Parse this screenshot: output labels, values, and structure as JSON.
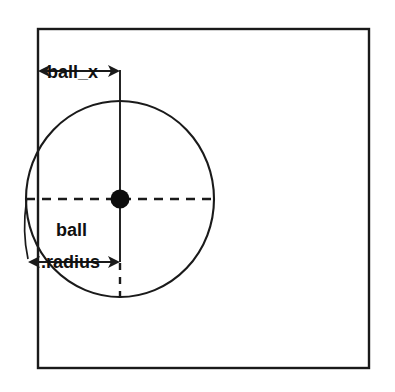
{
  "diagram": {
    "background_color": "#ffffff",
    "stroke_color": "#1a1a1a",
    "text_color": "#101010",
    "labels": {
      "ball_x": "ball_x",
      "ball_radius_line1": "ball",
      "ball_radius_line2": ".radius"
    },
    "shapes": {
      "play_field": {
        "name": "playfield-rectangle",
        "x": 38,
        "y": 29,
        "width": 331,
        "height": 339
      },
      "ball": {
        "name": "ball-circle",
        "center_x": 120,
        "center_y": 199,
        "radius_x": 94,
        "radius_y": 98
      },
      "ball_center_dot": {
        "name": "ball-center-dot",
        "center_x": 120,
        "center_y": 199,
        "radius": 9
      }
    },
    "dimensions": {
      "ball_x": {
        "name": "ball-x-dimension",
        "from_x": 38,
        "to_x": 120,
        "y": 71,
        "arrowheads": "both"
      },
      "ball_radius": {
        "name": "ball-radius-dimension",
        "from_x": 28,
        "to_x": 120,
        "y": 262,
        "arrowheads": "both"
      }
    },
    "guides": {
      "vertical_center_line": {
        "name": "vertical-center-guide",
        "x": 120,
        "solid_from_y": 70,
        "solid_to_y": 262,
        "dashed_from_y": 262,
        "dashed_to_y": 298
      },
      "horizontal_center_line": {
        "name": "horizontal-center-guide",
        "y": 199,
        "from_x": 26,
        "to_x": 213,
        "style": "dashed"
      },
      "radius_leader": {
        "name": "radius-leader-line",
        "from_x": 26,
        "from_y": 200,
        "to_x": 28,
        "to_y": 258
      }
    }
  }
}
